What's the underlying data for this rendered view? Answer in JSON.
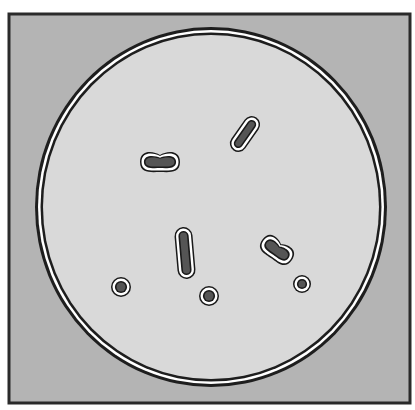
{
  "figure": {
    "colors": {
      "background": "#ffffff",
      "frame_fill": "#b4b4b4",
      "frame_stroke": "#2a2a2a",
      "dish_fill": "#d9d9d9",
      "dish_ring_outer": "#1e1e1e",
      "dish_ring_gap": "#ffffff",
      "cell_halo": "#ffffff",
      "cell_outline": "#1a1a1a",
      "cell_core": "#555555"
    },
    "frame": {
      "x": 9,
      "y": 14,
      "width": 401,
      "height": 389
    },
    "dish": {
      "cx": 211,
      "cy": 207,
      "rx": 176,
      "ry": 180
    },
    "cells": [
      {
        "name": "cell-bean-upper-left",
        "shape": "bean",
        "cx": 160,
        "cy": 162,
        "length": 40,
        "width": 20,
        "angle": 0
      },
      {
        "name": "cell-rod-upper-right",
        "shape": "rod",
        "cx": 245,
        "cy": 134,
        "length": 40,
        "width": 17,
        "angle": -55
      },
      {
        "name": "cell-rod-center",
        "shape": "rod",
        "cx": 185,
        "cy": 253,
        "length": 52,
        "width": 18,
        "angle": 85
      },
      {
        "name": "cell-bean-right",
        "shape": "bean",
        "cx": 277,
        "cy": 250,
        "length": 36,
        "width": 20,
        "angle": 35
      },
      {
        "name": "cell-round-left",
        "shape": "round",
        "cx": 121,
        "cy": 287,
        "r": 10
      },
      {
        "name": "cell-round-bottom",
        "shape": "round",
        "cx": 209,
        "cy": 296,
        "r": 10
      },
      {
        "name": "cell-round-right",
        "shape": "round",
        "cx": 302,
        "cy": 284,
        "r": 9
      }
    ]
  }
}
